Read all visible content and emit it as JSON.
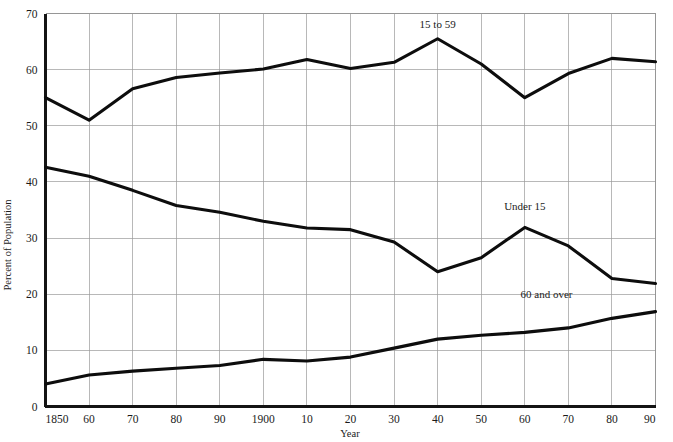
{
  "chart_data": {
    "type": "line",
    "title": "",
    "xlabel": "Year",
    "ylabel": "Percent of Population",
    "grid": true,
    "legend_position": "inline-annotations",
    "xlim": [
      1850,
      1990
    ],
    "ylim": [
      0,
      70
    ],
    "x": [
      1850,
      1860,
      1870,
      1880,
      1890,
      1900,
      1910,
      1920,
      1930,
      1940,
      1950,
      1960,
      1970,
      1980,
      1990
    ],
    "xtick_labels": [
      "1850",
      "60",
      "70",
      "80",
      "90",
      "1900",
      "10",
      "20",
      "30",
      "40",
      "50",
      "60",
      "70",
      "80",
      "90"
    ],
    "ytick_labels": [
      "0",
      "10",
      "20",
      "30",
      "40",
      "50",
      "60",
      "70"
    ],
    "ytick_values": [
      0,
      10,
      20,
      30,
      40,
      50,
      60,
      70
    ],
    "series": [
      {
        "name": "15 to 59",
        "label": "15 to 59",
        "color": "#0d0d0d",
        "values": [
          55.0,
          51.0,
          56.6,
          58.6,
          59.4,
          60.1,
          61.8,
          60.2,
          61.3,
          65.5,
          61.0,
          55.0,
          59.3,
          62.0,
          61.4
        ]
      },
      {
        "name": "Under 15",
        "label": "Under 15",
        "color": "#0d0d0d",
        "values": [
          42.6,
          41.0,
          38.5,
          35.8,
          34.6,
          33.0,
          31.8,
          31.5,
          29.3,
          24.0,
          26.5,
          31.9,
          28.6,
          22.8,
          21.9
        ]
      },
      {
        "name": "60 and over",
        "label": "60 and over",
        "color": "#0d0d0d",
        "values": [
          4.0,
          5.6,
          6.3,
          6.8,
          7.3,
          8.4,
          8.1,
          8.8,
          10.4,
          12.0,
          12.7,
          13.2,
          14.0,
          15.7,
          16.9
        ]
      }
    ],
    "annotations": [
      {
        "text": "15 to 59",
        "x": 1940,
        "y": 67.5
      },
      {
        "text": "Under 15",
        "x": 1960,
        "y": 35.0
      },
      {
        "text": "60 and over",
        "x": 1965,
        "y": 19.3
      }
    ]
  },
  "axes": {
    "y_axis_title": "Percent of Population",
    "x_axis_title": "Year"
  }
}
